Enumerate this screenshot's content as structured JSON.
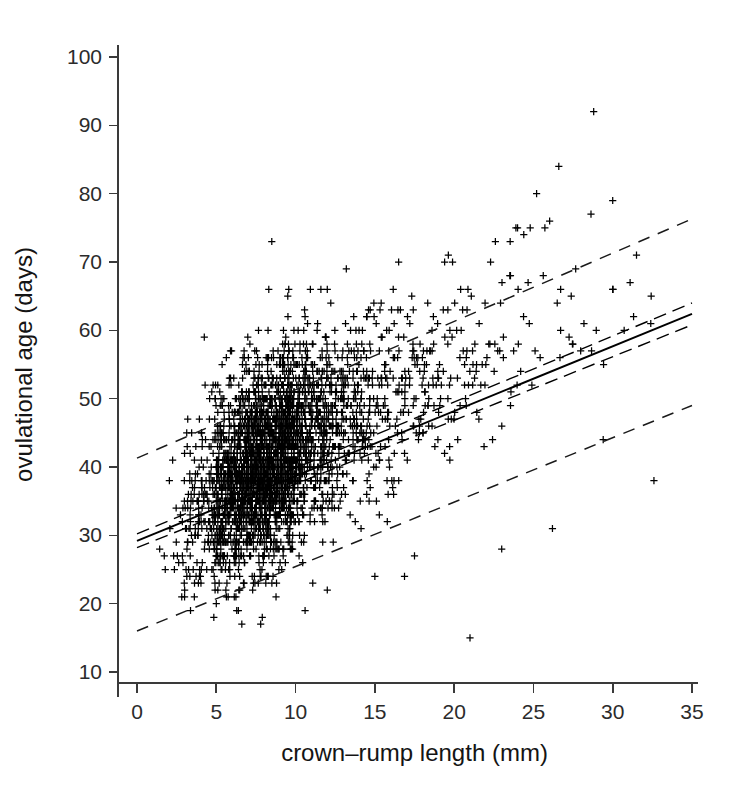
{
  "figure": {
    "background_color": "#ffffff",
    "ink_color": "#000000",
    "marker_symbol": "plus"
  },
  "chart_data": {
    "type": "scatter",
    "title": "",
    "xlabel": "crown–rump length (mm)",
    "ylabel": "ovulational age (days)",
    "xlim": [
      0,
      35
    ],
    "ylim": [
      10,
      100
    ],
    "xticks": [
      0,
      5,
      10,
      15,
      20,
      25,
      30,
      35
    ],
    "yticks": [
      10,
      20,
      30,
      40,
      50,
      60,
      70,
      80,
      90,
      100
    ],
    "xtick_labels": [
      "0",
      "5",
      "10",
      "15",
      "20",
      "25",
      "30",
      "35"
    ],
    "ytick_labels": [
      "10",
      "20",
      "30",
      "40",
      "50",
      "60",
      "70",
      "80",
      "90",
      "100"
    ],
    "grid": false,
    "legend": false,
    "marker": "plus",
    "n_points_approx": 2100,
    "cluster": {
      "x_mode": 9.0,
      "y_mode": 38.0,
      "x_range": [
        1.0,
        33.0
      ],
      "y_range": [
        14.0,
        92.0
      ],
      "description": "dense positively-correlated cloud of plus markers, densest between 5 and 13 mm and 30 to 45 days"
    },
    "series": [
      {
        "name": "observations",
        "style": "plus-markers",
        "x": [
          1.8,
          2.1,
          2.4,
          2.6,
          2.9,
          3.1,
          3.3,
          3.5,
          3.7,
          3.9,
          4.0,
          4.2,
          4.4,
          4.5,
          4.7,
          4.8,
          5.0,
          5.1,
          5.2,
          5.4,
          5.5,
          5.6,
          5.8,
          5.9,
          6.0,
          6.1,
          6.2,
          6.3,
          6.4,
          6.5,
          6.6,
          6.7,
          6.8,
          6.9,
          7.0,
          7.1,
          7.2,
          7.3,
          7.4,
          7.5,
          7.6,
          7.7,
          7.8,
          7.9,
          8.0,
          8.1,
          8.2,
          8.3,
          8.4,
          8.5,
          8.6,
          8.7,
          8.8,
          8.9,
          9.0,
          9.1,
          9.2,
          9.3,
          9.4,
          9.5,
          9.6,
          9.7,
          9.8,
          9.9,
          10.0,
          10.2,
          10.4,
          10.6,
          10.8,
          11.0,
          11.2,
          11.4,
          11.6,
          11.8,
          12.0,
          12.3,
          12.6,
          12.9,
          13.2,
          13.5,
          13.8,
          14.1,
          14.4,
          14.7,
          15.0,
          15.4,
          15.8,
          16.2,
          16.6,
          17.0,
          17.4,
          17.8,
          18.2,
          18.6,
          19.0,
          19.5,
          20.0,
          20.5,
          21.0,
          21.5,
          22.0,
          22.6,
          23.2,
          23.8,
          24.4,
          25.0,
          25.7,
          26.4,
          27.1,
          27.8,
          28.5,
          29.3,
          30.1,
          30.9,
          31.7,
          32.5
        ],
        "y_mean": [
          30.5,
          31.0,
          31.4,
          31.8,
          32.2,
          32.6,
          32.9,
          33.2,
          33.5,
          33.8,
          34.0,
          34.3,
          34.6,
          34.8,
          35.1,
          35.3,
          35.6,
          35.8,
          36.0,
          36.3,
          36.5,
          36.7,
          37.0,
          37.2,
          37.4,
          37.6,
          37.8,
          38.0,
          38.2,
          38.3,
          38.5,
          38.7,
          38.9,
          39.1,
          39.2,
          39.4,
          39.6,
          39.7,
          39.9,
          40.1,
          40.2,
          40.4,
          40.5,
          40.7,
          40.8,
          41.0,
          41.1,
          41.3,
          41.4,
          41.6,
          41.7,
          41.9,
          42.0,
          42.2,
          42.3,
          42.4,
          42.6,
          42.7,
          42.9,
          43.0,
          43.1,
          43.3,
          43.4,
          43.5,
          43.7,
          43.9,
          44.2,
          44.4,
          44.7,
          44.9,
          45.2,
          45.4,
          45.6,
          45.9,
          46.1,
          46.4,
          46.8,
          47.1,
          47.4,
          47.7,
          48.0,
          48.4,
          48.7,
          49.0,
          49.3,
          49.7,
          50.1,
          50.5,
          50.9,
          51.3,
          51.7,
          52.1,
          52.5,
          52.9,
          53.3,
          53.8,
          54.3,
          54.8,
          55.3,
          55.8,
          56.3,
          56.9,
          57.5,
          58.1,
          58.7,
          59.3,
          60.0,
          60.7,
          61.4,
          62.1,
          62.8,
          63.6,
          64.4,
          65.2,
          66.0,
          66.8
        ],
        "scatter_sd": 7.0
      }
    ],
    "fit": {
      "name": "regression line",
      "style": "solid",
      "intercept_days": 29.2,
      "slope_days_per_mm": 0.95,
      "x_start": 0,
      "x_end": 35,
      "y_start": 29.2,
      "y_end": 62.4
    },
    "confidence_band": {
      "name": "confidence interval",
      "style": "dashed (tight, flanking the fit line)",
      "offset_days": 1.0
    },
    "prediction_band": {
      "name": "prediction interval",
      "style": "dashed (wide)",
      "upper": {
        "y_start": 41.3,
        "y_end": 76.3
      },
      "lower": {
        "y_start": 16.0,
        "y_end": 49.0
      }
    }
  }
}
